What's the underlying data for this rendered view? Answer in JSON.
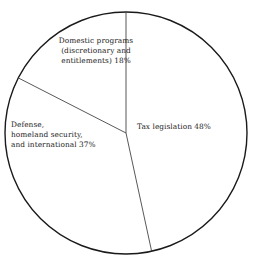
{
  "chart_data": {
    "type": "pie",
    "title": "",
    "subtitle": "",
    "xlabel": "",
    "ylabel": "",
    "legend_position": "none",
    "labels_inside": true,
    "grid": false,
    "categories": [
      "Tax legislation",
      "Defense, homeland security, and international",
      "Domestic programs (discretionary and entitlements)"
    ],
    "values": [
      48,
      37,
      18
    ],
    "units": "percent",
    "slices": [
      {
        "name": "Tax legislation",
        "value": 48,
        "value_label": "48%",
        "label_text": "Tax legislation 48%",
        "start_angle_deg": 0,
        "end_angle_deg": 172.8
      },
      {
        "name": "Defense, homeland security, and international",
        "value": 37,
        "value_label": "37%",
        "label_text": "Defense,\nhomeland security,\nand international 37%",
        "start_angle_deg": 172.8,
        "end_angle_deg": 306.0
      },
      {
        "name": "Domestic programs (discretionary and entitlements)",
        "value": 18,
        "value_label": "18%",
        "label_text": "Domestic programs\n(discretionary and\nentitlements) 18%",
        "start_angle_deg": 306.0,
        "end_angle_deg": 360.0
      }
    ]
  },
  "labels": {
    "domestic": "Domestic programs\n(discretionary and\nentitlements) 18%",
    "tax": "Tax legislation 48%",
    "defense": "Defense,\nhomeland security,\nand international 37%"
  },
  "style": {
    "outline_color": "#1a1a1a",
    "divider_color": "#3a3a3a",
    "slice_fill": "#ffffff",
    "background": "#ffffff",
    "text_color": "#1a1a1a"
  },
  "geometry": {
    "center_x": 126,
    "center_y": 133,
    "radius": 121,
    "outline_width": 1.4,
    "divider_width": 0.8
  }
}
